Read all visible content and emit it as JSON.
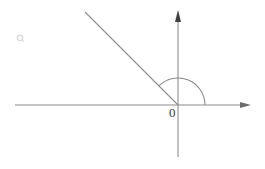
{
  "figure": {
    "kind": "geometry-diagram",
    "background_color": "#ffffff",
    "stroke_color": "#8c8c8c",
    "arc_color": "#8a8a8a",
    "label_color": "#3c3c3c",
    "origin_label": "0",
    "canvas": {
      "width": 265,
      "height": 169
    }
  },
  "chart_data": {
    "type": "scatter",
    "xlabel": "",
    "ylabel": "",
    "grid": false,
    "legend": null,
    "xlim": [
      -163,
      73
    ],
    "ylim": [
      -52,
      95
    ],
    "annotations": [
      {
        "name": "origin-label",
        "text": "0",
        "x": -8,
        "y": -12
      }
    ],
    "elements": [
      {
        "name": "x-axis",
        "kind": "axis-line",
        "from": [
          -163,
          0
        ],
        "to": [
          73,
          0
        ],
        "arrow_at": "end",
        "pixel_from": [
          15,
          105
        ],
        "pixel_to": [
          251,
          105
        ]
      },
      {
        "name": "y-axis",
        "kind": "axis-line",
        "from": [
          0,
          -52
        ],
        "to": [
          0,
          95
        ],
        "arrow_at": "end",
        "pixel_from": [
          178,
          157
        ],
        "pixel_to": [
          178,
          10
        ]
      },
      {
        "name": "ray",
        "kind": "ray",
        "from": [
          0,
          0
        ],
        "to": [
          -93,
          93
        ],
        "angle_degrees": 135,
        "pixel_from": [
          178,
          105
        ],
        "pixel_to": [
          85,
          12
        ]
      },
      {
        "name": "angle-arc",
        "kind": "arc",
        "center": [
          0,
          0
        ],
        "radius": 27,
        "start_angle_degrees": 0,
        "end_angle_degrees": 135,
        "measure_degrees": 135
      }
    ],
    "marks": [
      {
        "name": "faint-artifact",
        "pixel": [
          20,
          38
        ],
        "color": "#d8d8d8"
      }
    ]
  }
}
